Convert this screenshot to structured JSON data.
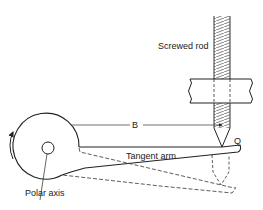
{
  "diagram": {
    "labels": {
      "screwed_rod": "Screwed rod",
      "distance": "B",
      "tangent_arm": "Tangent arm",
      "point": "Q",
      "polar_axis": "Polar axis"
    },
    "colors": {
      "line": "#222222",
      "background": "#ffffff"
    }
  }
}
